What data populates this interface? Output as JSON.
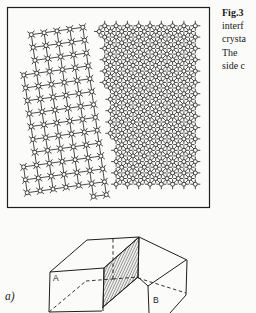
{
  "colors": {
    "ink": "#1e1e1e",
    "paper": "#fbfbf9"
  },
  "caption": {
    "lines": [
      "Fig.3",
      "interf",
      "crysta",
      "The",
      "side c"
    ]
  },
  "figures": {
    "top": {
      "name": "bicrystal-interface-lattice-diagram",
      "panel": {
        "x": 7.5,
        "y": 7.5,
        "width": 202,
        "height": 200
      },
      "boundary": {
        "x0": 96,
        "y0": 25,
        "slope": 0.11
      },
      "atom": {
        "radius": 2,
        "whisker_length": 5
      },
      "grains": [
        {
          "id": "grain-left",
          "side": "left",
          "spacing": 13,
          "angle": -8,
          "origin": [
            55,
            110
          ],
          "range": 12,
          "gap": 4,
          "region": {
            "top": 27,
            "bottom": 198,
            "xmin": 23,
            "xmax": 96
          }
        },
        {
          "id": "grain-right",
          "side": "right",
          "spacing": 8,
          "angle": 45,
          "origin": [
            150,
            105
          ],
          "range": 18,
          "gap": 2,
          "region": {
            "top": 25,
            "bottom": 189,
            "xmin": 96,
            "xmax": 197
          }
        }
      ]
    },
    "bottom": {
      "name": "bicrystal-block-diagram",
      "labels": {
        "sub_label": "a)",
        "block_a": "A",
        "block_b": "B"
      },
      "hatch_points": "104,268 139,237 138,277 103,307",
      "solid_edges": [
        [
          50,
          272,
          104,
          268
        ],
        [
          50,
          272,
          49,
          312
        ],
        [
          49,
          312,
          102,
          311
        ],
        [
          104,
          268,
          103,
          311
        ],
        [
          50,
          272,
          87,
          240
        ],
        [
          87,
          240,
          139,
          237
        ],
        [
          104,
          268,
          139,
          237
        ],
        [
          139,
          237,
          138,
          277
        ],
        [
          138,
          277,
          102,
          308
        ],
        [
          139,
          237,
          187,
          260
        ],
        [
          187,
          260,
          186,
          295
        ],
        [
          186,
          295,
          170,
          313
        ],
        [
          148,
          286,
          186,
          260
        ],
        [
          138,
          277,
          148,
          286
        ],
        [
          148,
          286,
          149,
          313
        ]
      ],
      "hidden_edges": [
        [
          49,
          312,
          86,
          281
        ],
        [
          86,
          281,
          113,
          279
        ],
        [
          113,
          279,
          138,
          277
        ],
        [
          113,
          239,
          113,
          279
        ],
        [
          138,
          278,
          186,
          293
        ]
      ]
    }
  }
}
